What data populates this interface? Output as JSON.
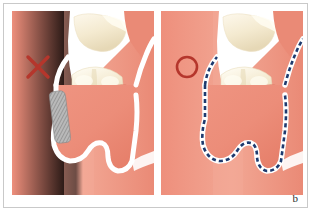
{
  "figure": {
    "label": "b",
    "caption_letter": "b"
  },
  "colors": {
    "gingiva_base": "#ef9582",
    "gingiva_light": "#f2a893",
    "gingiva_flap": "#ea8a76",
    "gingiva_deep": "#e0715c",
    "tooth_enamel": "#f7f0dd",
    "tooth_shadow": "#e8dcc0",
    "outline_white": "#ffffff",
    "mark_red": "#b5362c",
    "dashed_blue": "#1e3a6e",
    "hatch_grey": "#9a9a9a",
    "frame_border": "#c9c9c9",
    "page_background": "#ffffff"
  },
  "panels": [
    {
      "id": "panel-incorrect",
      "name": "incorrect-technique-panel",
      "mark": "✕",
      "mark_name": "cross-mark",
      "mark_meaning": "incorrect",
      "incision_style": "hatched",
      "incision_color": "#9a9a9a",
      "annotation_name": "hatched-incision-segment"
    },
    {
      "id": "panel-correct",
      "name": "correct-technique-panel",
      "mark": "○",
      "mark_name": "circle-mark",
      "mark_meaning": "correct",
      "incision_style": "dashed",
      "incision_color": "#1e3a6e",
      "annotation_name": "dashed-flap-outline"
    }
  ]
}
